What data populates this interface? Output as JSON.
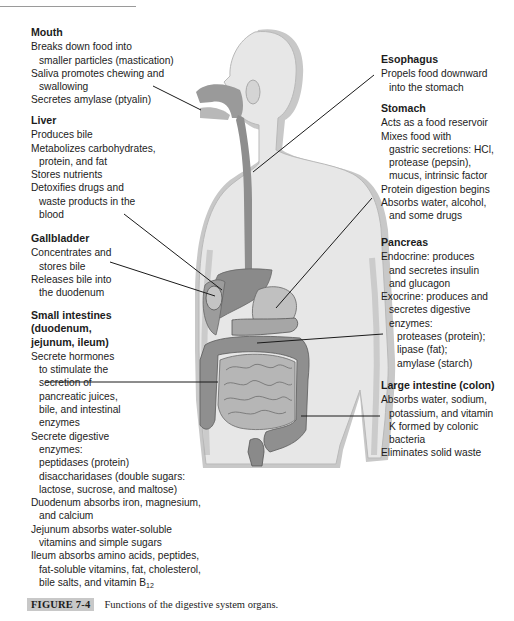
{
  "figure": {
    "caption_label": "FIGURE 7-4",
    "caption_text": "Functions of the digestive system organs."
  },
  "organs": {
    "mouth": {
      "title": "Mouth",
      "lines": [
        "Breaks down food into",
        "smaller particles (mastication)",
        "Saliva promotes chewing and",
        "swallowing",
        "Secretes amylase (ptyalin)"
      ]
    },
    "liver": {
      "title": "Liver",
      "lines": [
        "Produces bile",
        "Metabolizes carbohydrates,",
        "protein, and fat",
        "Stores nutrients",
        "Detoxifies drugs and",
        "waste products in the",
        "blood"
      ]
    },
    "gallbladder": {
      "title": "Gallbladder",
      "lines": [
        "Concentrates and",
        "stores bile",
        "Releases bile into",
        "the duodenum"
      ]
    },
    "small_intestines": {
      "title_lines": [
        "Small intestines",
        "(duodenum,",
        "jejunum, ileum)"
      ],
      "lines": [
        "Secrete hormones",
        "to stimulate the",
        "secretion of",
        "pancreatic juices,",
        "bile, and intestinal",
        "enzymes",
        "Secrete digestive",
        "enzymes:",
        "peptidases (protein)",
        "disaccharidases (double sugars:",
        "lactose, sucrose, and maltose)",
        "Duodenum absorbs iron, magnesium,",
        "and calcium",
        "Jejunum absorbs water-soluble",
        "vitamins and simple sugars",
        "Ileum absorbs amino acids, peptides,",
        "fat-soluble vitamins, fat, cholesterol,",
        "bile salts, and vitamin B",
        "12"
      ]
    },
    "esophagus": {
      "title": "Esophagus",
      "lines": [
        "Propels food downward",
        "into the stomach"
      ]
    },
    "stomach": {
      "title": "Stomach",
      "lines": [
        "Acts as a food reservoir",
        "Mixes food with",
        "gastric secretions: HCl,",
        "protease (pepsin),",
        "mucus, intrinsic factor",
        "Protein digestion begins",
        "Absorbs water, alcohol,",
        "and some drugs"
      ]
    },
    "pancreas": {
      "title": "Pancreas",
      "lines": [
        "Endocrine: produces",
        "and secretes insulin",
        "and glucagon",
        "Exocrine: produces and",
        "secretes digestive",
        "enzymes:",
        "proteases (protein);",
        "lipase (fat);",
        "amylase (starch)"
      ]
    },
    "large_intestine": {
      "title": "Large intestine (colon)",
      "lines": [
        "Absorbs water, sodium,",
        "potassium, and vitamin",
        "K formed by colonic",
        "bacteria",
        "Eliminates solid waste"
      ]
    }
  },
  "colors": {
    "body_fill": "#e6e6e6",
    "body_shadow": "#c4c4c4",
    "organ_dark": "#8c8c8c",
    "organ_mid": "#a8a8a8",
    "leader_line": "#1a1a1a",
    "caption_label_bg": "#c8c8c8"
  }
}
